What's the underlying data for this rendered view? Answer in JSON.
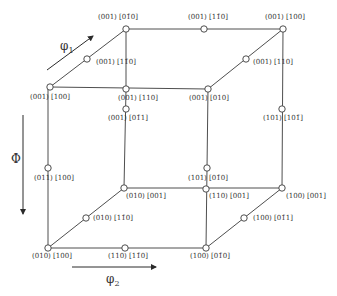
{
  "diagram": {
    "colors": {
      "line": "#3a3a3a",
      "text": "#333333",
      "background": "#ffffff"
    },
    "axes": [
      {
        "id": "phi1",
        "label": "φ",
        "sub": "1",
        "x1": 47,
        "y1": 70,
        "x2": 93,
        "y2": 36,
        "lx": 60,
        "ly": 50
      },
      {
        "id": "Phi",
        "label": "Φ",
        "sub": "",
        "x1": 23,
        "y1": 115,
        "x2": 23,
        "y2": 214,
        "lx": 11,
        "ly": 163
      },
      {
        "id": "phi2",
        "label": "φ",
        "sub": "2",
        "x1": 72,
        "y1": 267,
        "x2": 156,
        "y2": 267,
        "lx": 106,
        "ly": 283
      }
    ],
    "edges": [
      [
        126,
        29,
        283,
        29
      ],
      [
        50,
        87,
        126,
        29
      ],
      [
        283,
        29,
        208,
        89
      ],
      [
        50,
        87,
        208,
        89
      ],
      [
        126,
        29,
        126,
        89
      ],
      [
        126,
        89,
        124,
        188
      ],
      [
        283,
        29,
        282,
        188
      ],
      [
        208,
        89,
        206,
        248
      ],
      [
        48,
        87,
        48,
        248
      ],
      [
        124,
        188,
        282,
        188
      ],
      [
        48,
        248,
        206,
        248
      ],
      [
        48,
        248,
        124,
        188
      ],
      [
        206,
        248,
        282,
        188
      ]
    ],
    "nodes": [
      {
        "x": 126,
        "y": 29,
        "label": "(001) [01̄0]",
        "lx": 98,
        "ly": 19
      },
      {
        "x": 204,
        "y": 29,
        "label": "(001) [11̄0]",
        "lx": 188,
        "ly": 19
      },
      {
        "x": 283,
        "y": 29,
        "label": "(001) [100]",
        "lx": 265,
        "ly": 19
      },
      {
        "x": 87,
        "y": 59,
        "label": "(001) [11̄0]",
        "lx": 96,
        "ly": 64
      },
      {
        "x": 246,
        "y": 59,
        "label": "(001) [110]",
        "lx": 253,
        "ly": 64
      },
      {
        "x": 50,
        "y": 87,
        "label": "(001) [100]",
        "lx": 30,
        "ly": 99
      },
      {
        "x": 126,
        "y": 89,
        "label": "(001) [110]",
        "lx": 118,
        "ly": 100
      },
      {
        "x": 208,
        "y": 89,
        "label": "(001) [010]",
        "lx": 189,
        "ly": 100
      },
      {
        "x": 126,
        "y": 109,
        "label": "(001) [01̄1]",
        "lx": 108,
        "ly": 120
      },
      {
        "x": 282,
        "y": 109,
        "label": "(101) [101̄]",
        "lx": 263,
        "ly": 120
      },
      {
        "x": 48,
        "y": 168,
        "label": "(011) [100]",
        "lx": 34,
        "ly": 180
      },
      {
        "x": 207,
        "y": 168,
        "label": "(101) [01̄0]",
        "lx": 188,
        "ly": 180
      },
      {
        "x": 124,
        "y": 188,
        "label": "(010) [001]",
        "lx": 126,
        "ly": 198
      },
      {
        "x": 206,
        "y": 189,
        "label": "(110) [001]",
        "lx": 209,
        "ly": 198
      },
      {
        "x": 282,
        "y": 188,
        "label": "(100) [001]",
        "lx": 286,
        "ly": 198
      },
      {
        "x": 86,
        "y": 218,
        "label": "(010) [11̄0]",
        "lx": 93,
        "ly": 220
      },
      {
        "x": 244,
        "y": 218,
        "label": "(100) [01̄1]",
        "lx": 253,
        "ly": 220
      },
      {
        "x": 48,
        "y": 248,
        "label": "(010) [100]",
        "lx": 32,
        "ly": 258
      },
      {
        "x": 125,
        "y": 248,
        "label": "(110) [11̄0]",
        "lx": 108,
        "ly": 258
      },
      {
        "x": 206,
        "y": 248,
        "label": "(100) [01̄0]",
        "lx": 190,
        "ly": 258
      }
    ]
  }
}
